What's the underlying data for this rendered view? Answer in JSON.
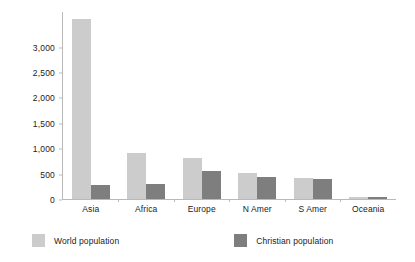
{
  "chart_data": {
    "type": "bar",
    "title": "",
    "subtitle": "",
    "xlabel": "",
    "ylabel": "",
    "categories": [
      "Asia",
      "Africa",
      "Europe",
      "N Amer",
      "S Amer",
      "Oceania"
    ],
    "series": [
      {
        "name": "World population",
        "color": "#cccccc",
        "values": [
          3540,
          900,
          800,
          510,
          410,
          35
        ]
      },
      {
        "name": "Christian population",
        "color": "#7e7e7e",
        "values": [
          275,
          290,
          545,
          430,
          400,
          30
        ]
      }
    ],
    "ylim": [
      0,
      3700
    ],
    "yticks": [
      0,
      500,
      1000,
      1500,
      2000,
      2500,
      3000
    ],
    "ytick_labels": [
      "0",
      "500",
      "1,000",
      "1,500",
      "2,000",
      "2,500",
      "3,000"
    ],
    "grid": false,
    "legend_position": "bottom"
  },
  "legend": {
    "items": [
      {
        "label": "World population",
        "swatch": "world-population-swatch"
      },
      {
        "label": "Christian population",
        "swatch": "christian-population-swatch"
      }
    ]
  }
}
